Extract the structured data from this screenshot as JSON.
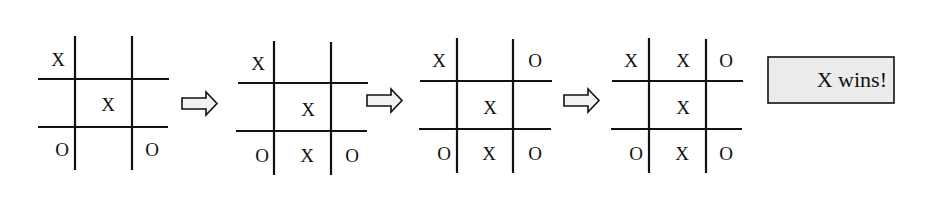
{
  "diagram": {
    "boards": [
      {
        "id": "board-1",
        "cells": [
          [
            "X",
            "",
            ""
          ],
          [
            "",
            "X",
            ""
          ],
          [
            "O",
            "",
            "O"
          ]
        ]
      },
      {
        "id": "board-2",
        "cells": [
          [
            "X",
            "",
            ""
          ],
          [
            "",
            "X",
            ""
          ],
          [
            "O",
            "X",
            "O"
          ]
        ]
      },
      {
        "id": "board-3",
        "cells": [
          [
            "X",
            "",
            "O"
          ],
          [
            "",
            "X",
            ""
          ],
          [
            "O",
            "X",
            "O"
          ]
        ]
      },
      {
        "id": "board-4",
        "cells": [
          [
            "X",
            "X",
            "O"
          ],
          [
            "",
            "X",
            ""
          ],
          [
            "O",
            "X",
            "O"
          ]
        ]
      }
    ],
    "arrows": [
      "right-arrow",
      "right-arrow",
      "right-arrow"
    ],
    "result": {
      "label": "X wins!"
    }
  },
  "colors": {
    "line": "#111111",
    "arrow_fill": "#f2f2f2",
    "result_fill": "#ececec",
    "background": "#ffffff"
  }
}
